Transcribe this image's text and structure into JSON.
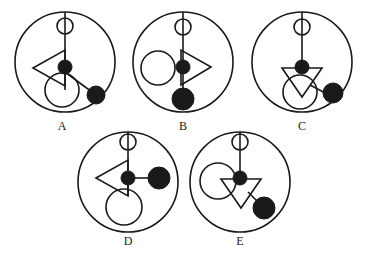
{
  "figure": {
    "stroke_color": "#1a1a1a",
    "fill_color": "#1a1a1a",
    "background_color": "#ffffff",
    "panel_count": 5
  },
  "labels": {
    "a": "A",
    "b": "B",
    "c": "C",
    "d": "D",
    "e": "E"
  },
  "panels": [
    {
      "id": "A",
      "label": "A",
      "center": [
        65,
        62
      ],
      "radius": 50,
      "elements": [
        {
          "name": "small-open-circle-top",
          "type": "circle",
          "filled": false,
          "cx": 65,
          "cy": 26,
          "r": 8
        },
        {
          "name": "vertical-stem-line",
          "type": "line",
          "x1": 65,
          "y1": 12,
          "x2": 65,
          "y2": 90
        },
        {
          "name": "left-pointing-triangle",
          "type": "triangle",
          "direction": "left",
          "points": "33,68 65,50 65,86"
        },
        {
          "name": "center-filled-dot",
          "type": "circle",
          "filled": true,
          "cx": 65,
          "cy": 67,
          "r": 7
        },
        {
          "name": "lower-open-circle",
          "type": "circle",
          "filled": false,
          "cx": 62,
          "cy": 90,
          "r": 17
        },
        {
          "name": "connector-line-to-dot",
          "type": "line",
          "x1": 65,
          "y1": 72,
          "x2": 96,
          "y2": 95
        },
        {
          "name": "lower-right-filled-dot",
          "type": "circle",
          "filled": true,
          "cx": 96,
          "cy": 95,
          "r": 9
        }
      ]
    },
    {
      "id": "B",
      "label": "B",
      "center": [
        183,
        62
      ],
      "radius": 50,
      "elements": [
        {
          "name": "small-open-circle-top",
          "type": "circle",
          "filled": false,
          "cx": 183,
          "cy": 27,
          "r": 8
        },
        {
          "name": "vertical-stem-line",
          "type": "line",
          "x1": 183,
          "y1": 12,
          "x2": 183,
          "y2": 99
        },
        {
          "name": "left-open-circle",
          "type": "circle",
          "filled": false,
          "cx": 158,
          "cy": 68,
          "r": 17
        },
        {
          "name": "right-pointing-triangle",
          "type": "triangle",
          "direction": "right",
          "points": "211,67 181,50 181,85"
        },
        {
          "name": "center-filled-dot",
          "type": "circle",
          "filled": true,
          "cx": 183,
          "cy": 67,
          "r": 7
        },
        {
          "name": "bottom-filled-dot",
          "type": "circle",
          "filled": true,
          "cx": 183,
          "cy": 99,
          "r": 11
        }
      ]
    },
    {
      "id": "C",
      "label": "C",
      "center": [
        302,
        62
      ],
      "radius": 50,
      "elements": [
        {
          "name": "small-open-circle-top",
          "type": "circle",
          "filled": false,
          "cx": 302,
          "cy": 27,
          "r": 8
        },
        {
          "name": "vertical-stem-line",
          "type": "line",
          "x1": 302,
          "y1": 12,
          "x2": 302,
          "y2": 68
        },
        {
          "name": "center-filled-dot",
          "type": "circle",
          "filled": true,
          "cx": 302,
          "cy": 67,
          "r": 7
        },
        {
          "name": "down-pointing-triangle",
          "type": "triangle",
          "direction": "down",
          "points": "282,68 322,68 302,97"
        },
        {
          "name": "lower-open-circle",
          "type": "circle",
          "filled": false,
          "cx": 300,
          "cy": 92,
          "r": 17
        },
        {
          "name": "connector-line-to-dot",
          "type": "line",
          "x1": 310,
          "y1": 85,
          "x2": 333,
          "y2": 97
        },
        {
          "name": "lower-right-filled-dot",
          "type": "circle",
          "filled": true,
          "cx": 333,
          "cy": 93,
          "r": 10
        }
      ]
    },
    {
      "id": "D",
      "label": "D",
      "center": [
        128,
        182
      ],
      "radius": 50,
      "elements": [
        {
          "name": "small-open-circle-top",
          "type": "circle",
          "filled": false,
          "cx": 128,
          "cy": 142,
          "r": 8
        },
        {
          "name": "vertical-stem-line",
          "type": "line",
          "x1": 128,
          "y1": 132,
          "x2": 128,
          "y2": 196
        },
        {
          "name": "left-pointing-triangle",
          "type": "triangle",
          "direction": "left",
          "points": "96,178 128,160 128,196"
        },
        {
          "name": "center-filled-dot",
          "type": "circle",
          "filled": true,
          "cx": 128,
          "cy": 178,
          "r": 7
        },
        {
          "name": "horizontal-connector-line",
          "type": "line",
          "x1": 128,
          "y1": 178,
          "x2": 159,
          "y2": 178
        },
        {
          "name": "right-filled-dot",
          "type": "circle",
          "filled": true,
          "cx": 159,
          "cy": 178,
          "r": 11
        },
        {
          "name": "lower-open-circle",
          "type": "circle",
          "filled": false,
          "cx": 124,
          "cy": 207,
          "r": 18
        }
      ]
    },
    {
      "id": "E",
      "label": "E",
      "center": [
        240,
        182
      ],
      "radius": 50,
      "elements": [
        {
          "name": "small-open-circle-top",
          "type": "circle",
          "filled": false,
          "cx": 240,
          "cy": 142,
          "r": 8
        },
        {
          "name": "vertical-stem-line",
          "type": "line",
          "x1": 240,
          "y1": 132,
          "x2": 240,
          "y2": 180
        },
        {
          "name": "left-open-circle",
          "type": "circle",
          "filled": false,
          "cx": 218,
          "cy": 181,
          "r": 18
        },
        {
          "name": "down-pointing-triangle",
          "type": "triangle",
          "direction": "down",
          "points": "221,179 261,179 241,208"
        },
        {
          "name": "center-filled-dot",
          "type": "circle",
          "filled": true,
          "cx": 240,
          "cy": 178,
          "r": 7
        },
        {
          "name": "connector-line-to-dot",
          "type": "line",
          "x1": 248,
          "y1": 192,
          "x2": 264,
          "y2": 208
        },
        {
          "name": "lower-right-filled-dot",
          "type": "circle",
          "filled": true,
          "cx": 264,
          "cy": 208,
          "r": 11
        }
      ]
    }
  ]
}
